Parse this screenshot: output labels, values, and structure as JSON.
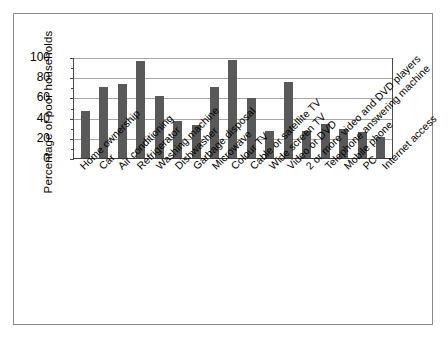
{
  "chart_data": {
    "type": "bar",
    "title": "",
    "subtitle": "",
    "xlabel": "",
    "ylabel": "Percentage of poor households",
    "ylim": [
      0,
      100
    ],
    "yticks": [
      0,
      20,
      40,
      60,
      80,
      100
    ],
    "grid": true,
    "legend": false,
    "legend_position": "none",
    "orientation": "vertical",
    "bar_color": "#595959",
    "categories": [
      "Home ownership",
      "Car",
      "Air conditioning",
      "Refrigerator",
      "Washing machine",
      "Dishwasher",
      "Garbage disposal",
      "Microwave",
      "Colour TV",
      "Cable or satellite TV",
      "Wide screen TV",
      "Video or DVD",
      "2 or more video and DVD players",
      "Telephone answering machine",
      "Mobile phone",
      "PC",
      "Internet access"
    ],
    "values": [
      47,
      70,
      73,
      96,
      61,
      37,
      33,
      70,
      97,
      59,
      27,
      75,
      27,
      34,
      29,
      26,
      21
    ]
  },
  "axes": {
    "y_title": "Percentage of poor households",
    "y_tick_labels": [
      "100",
      "80",
      "60",
      "40",
      "20",
      "0"
    ]
  },
  "colors": {
    "bar": "#595959",
    "gridline": "#a7a7a7",
    "axis": "#4a4a4a",
    "frame": "#8a8a8a",
    "background": "#ffffff"
  }
}
